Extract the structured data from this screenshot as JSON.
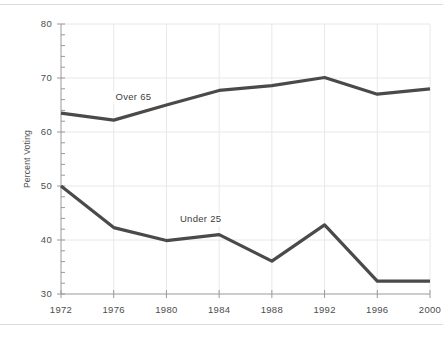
{
  "chart_data": {
    "type": "line",
    "title": "",
    "subtitle": "",
    "xlabel": "",
    "ylabel": "Percent Voting",
    "x": [
      1972,
      1976,
      1980,
      1984,
      1988,
      1992,
      1996,
      2000
    ],
    "categories": [
      "1972",
      "1976",
      "1980",
      "1984",
      "1988",
      "1992",
      "1996",
      "2000"
    ],
    "xlim": [
      1972,
      2000
    ],
    "ylim": [
      30,
      80
    ],
    "y_major_ticks": [
      30,
      40,
      50,
      60,
      70,
      80
    ],
    "y_tick_labels": [
      "30",
      "40",
      "50",
      "60",
      "70",
      "80"
    ],
    "y_minor_tick_step": 2,
    "x_tick_labels": [
      "1972",
      "1976",
      "1980",
      "1984",
      "1988",
      "1992",
      "1996",
      "2000"
    ],
    "grid": true,
    "grid_color": "#e8e8e8",
    "legend": "inline-annotations",
    "legend_position": "inline",
    "line_color": "#4a4a4a",
    "line_width": 3.2,
    "series": [
      {
        "name": "Over 65",
        "label": "Over 65",
        "values": [
          63.5,
          62.2,
          65.0,
          67.7,
          68.6,
          70.1,
          67.0,
          68.0
        ],
        "annotation_x": 1977.5,
        "annotation_y": 66.0
      },
      {
        "name": "Under 25",
        "label": "Under 25",
        "values": [
          50.0,
          42.3,
          39.9,
          41.0,
          36.1,
          42.8,
          32.4,
          32.4
        ],
        "annotation_x": 1982.6,
        "annotation_y": 43.3
      }
    ],
    "annotations": [
      {
        "text": "Over 65",
        "x": 1977.5,
        "y": 66.0
      },
      {
        "text": "Under 25",
        "x": 1982.6,
        "y": 43.3
      }
    ]
  },
  "figure": {
    "background_color": "#ffffff",
    "frame_color": "#dcdcdc",
    "axis_color": "#9a9a9a",
    "text_color": "#4d4d4d"
  }
}
